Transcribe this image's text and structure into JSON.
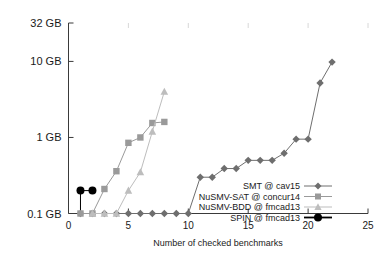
{
  "chart_data": {
    "type": "line",
    "title": "",
    "xlabel": "Number of checked benchmarks",
    "ylabel": "",
    "xlim": [
      0,
      25
    ],
    "ylim": [
      0.1,
      32
    ],
    "yscale": "log",
    "grid": false,
    "legend_position": "bottom-right",
    "xticks": [
      "0",
      "5",
      "10",
      "15",
      "20",
      "25"
    ],
    "xtick_values": [
      0,
      5,
      10,
      15,
      20,
      25
    ],
    "yticks": [
      "0.1 GB",
      "1 GB",
      "10 GB",
      "32 GB"
    ],
    "ytick_values": [
      0.1,
      1,
      10,
      32
    ],
    "series": [
      {
        "name": "SMT @ cav15",
        "marker": "diamond",
        "color": "#6e6e6e",
        "x": [
          1,
          2,
          3,
          4,
          5,
          6,
          7,
          8,
          9,
          10,
          11,
          12,
          13,
          14,
          15,
          16,
          17,
          18,
          19,
          20,
          21,
          22
        ],
        "y": [
          0.1,
          0.1,
          0.1,
          0.1,
          0.1,
          0.1,
          0.1,
          0.1,
          0.1,
          0.1,
          0.3,
          0.3,
          0.39,
          0.39,
          0.5,
          0.5,
          0.5,
          0.62,
          0.95,
          0.95,
          5.2,
          9.8
        ]
      },
      {
        "name": "NuSMV-SAT @ concur14",
        "marker": "square",
        "color": "#9a9a9a",
        "x": [
          1,
          2,
          3,
          4,
          5,
          6,
          7,
          8
        ],
        "y": [
          0.1,
          0.1,
          0.21,
          0.36,
          0.85,
          1.0,
          1.55,
          1.6
        ]
      },
      {
        "name": "NuSMV-BDD @ fmcad13",
        "marker": "triangle",
        "color": "#bdbdbd",
        "x": [
          2,
          3,
          4,
          5,
          6,
          7,
          8
        ],
        "y": [
          0.1,
          0.1,
          0.1,
          0.2,
          0.35,
          1.2,
          4.0
        ]
      },
      {
        "name": "SPIN @ fmcad13",
        "marker": "circle",
        "color": "#000000",
        "x": [
          1,
          2
        ],
        "y": [
          0.2,
          0.2
        ]
      }
    ]
  },
  "legend": {
    "items": [
      {
        "label": "SMT @ cav15"
      },
      {
        "label": "NuSMV-SAT @ concur14"
      },
      {
        "label": "NuSMV-BDD @ fmcad13"
      },
      {
        "label": "SPIN @ fmcad13"
      }
    ]
  }
}
